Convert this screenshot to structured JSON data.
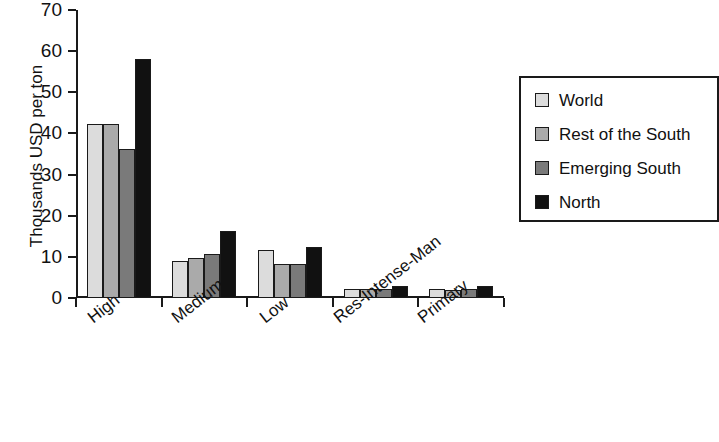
{
  "chart_data": {
    "type": "bar",
    "title": "",
    "xlabel": "",
    "ylabel": "Thousands USD per ton",
    "ylim": [
      0,
      70
    ],
    "yticks": [
      0,
      10,
      20,
      30,
      40,
      50,
      60,
      70
    ],
    "ytick_labels": [
      "0",
      "10",
      "20",
      "30",
      "40",
      "50",
      "60",
      "70"
    ],
    "grid": false,
    "legend_position": "right",
    "categories": [
      "High",
      "Medium",
      "Low",
      "Res-Intense-Man",
      "Primary"
    ],
    "series": [
      {
        "name": "World",
        "color": "#dcdcdc",
        "values": [
          42.4,
          9.0,
          11.7,
          2.2,
          2.2
        ]
      },
      {
        "name": "Rest of the South",
        "color": "#aaaaaa",
        "values": [
          42.4,
          9.8,
          8.3,
          2.1,
          2.0
        ]
      },
      {
        "name": "Emerging South",
        "color": "#7a7a7a",
        "values": [
          36.2,
          10.7,
          8.3,
          2.2,
          2.3
        ]
      },
      {
        "name": "North",
        "color": "#111111",
        "values": [
          58.2,
          16.3,
          12.5,
          3.0,
          3.0
        ]
      }
    ]
  },
  "legend": {
    "items": [
      {
        "label": "World",
        "swatch": "legend-swatch-world"
      },
      {
        "label": "Rest of the South",
        "swatch": "legend-swatch-rest-of-the-south"
      },
      {
        "label": "Emerging South",
        "swatch": "legend-swatch-emerging-south"
      },
      {
        "label": "North",
        "swatch": "legend-swatch-north"
      }
    ]
  }
}
